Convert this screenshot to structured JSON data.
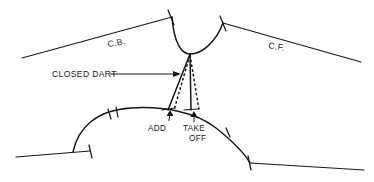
{
  "diagram": {
    "ink_color": "#171717",
    "background_color": "#ffffff",
    "labels": {
      "center_back": "C.B.",
      "center_front": "C.F.",
      "closed_dart": "CLOSED DART",
      "add": "ADD",
      "take_off_line1": "TAKE",
      "take_off_line2": "OFF"
    },
    "label_positions": {
      "center_back": {
        "x": 108,
        "y": 47,
        "rotation": -9
      },
      "center_front": {
        "x": 268,
        "y": 48,
        "rotation": 10
      },
      "closed_dart": {
        "x": 52,
        "y": 77
      },
      "add": {
        "x": 148,
        "y": 128
      },
      "take_off_line1": {
        "x": 186,
        "y": 128
      },
      "take_off_line2": {
        "x": 191,
        "y": 138
      }
    },
    "geometry": {
      "center_back_shoulder_line": "M 22,58 L 172,17",
      "center_front_shoulder_line": "M 223,23 L 361,62",
      "neckline_curve": "M 172,17 C 174,44 182,54 190,54 C 202,54 216,42 223,23",
      "dart_leg_left_solid": "M 190,54 L 168,110",
      "dart_leg_right_solid": "M 190,54 L 191,110",
      "dart_leg_left_dashed": "M 190,55 L 174,110",
      "dart_leg_right_dashed": "M 190,55 L 199,110",
      "armhole_curve": "M 73,152 C 78,128 96,110 131,108 C 163,106 196,112 216,128 C 236,144 246,156 250,163",
      "bottom_line_left": "M 16,157 L 90,151",
      "bottom_line_right": "M 250,163 L 364,170",
      "tick_shoulder_left": {
        "x": 172,
        "y": 17,
        "angle": -9
      },
      "tick_shoulder_right": {
        "x": 223,
        "y": 23,
        "angle": 10
      },
      "tick_armhole_left_1": {
        "x": 110,
        "y": 114
      },
      "tick_armhole_left_2": {
        "x": 117,
        "y": 112
      },
      "tick_armhole_right_1": {
        "x": 228,
        "y": 133
      },
      "cross_bottom_left": {
        "x": 91,
        "y": 151
      },
      "cross_bottom_right": {
        "x": 250,
        "y": 163
      },
      "cross_dart_base_left": {
        "x": 168,
        "y": 110
      },
      "cross_dart_base_right": {
        "x": 191,
        "y": 110
      },
      "leader_closed_dart": "M 110,74 L 176,74",
      "arrow_closed_dart": {
        "x": 179,
        "y": 74,
        "direction": "right"
      },
      "arrow_add": {
        "x": 170,
        "y": 113,
        "direction": "up"
      },
      "arrow_take_off": {
        "x": 194,
        "y": 114,
        "direction": "up"
      }
    }
  }
}
